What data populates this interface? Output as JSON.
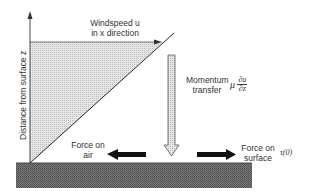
{
  "diagram": {
    "y_axis_label": "Distance from surface z",
    "wind_label_line1": "Windspeed u",
    "wind_label_line2": "in x direction",
    "momentum_label_line1": "Momentum",
    "momentum_label_line2": "transfer",
    "momentum_symbol": "μ",
    "momentum_frac_num": "∂u",
    "momentum_frac_den": "∂z",
    "force_air_line1": "Force on",
    "force_air_line2": "air",
    "force_surface_line1": "Force on",
    "force_surface_line2": "surface",
    "stress_label": "τ(0)",
    "colors": {
      "ground": "#6a6a6a",
      "profile_fill": "#dcdcdc",
      "arrow_fill": "#111111",
      "line": "#333333"
    }
  }
}
